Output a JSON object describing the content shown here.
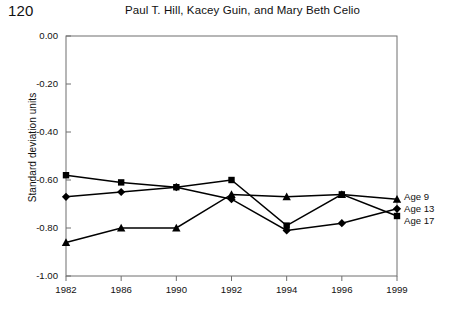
{
  "header": {
    "folio": "120",
    "running_title": "Paul T. Hill, Kacey Guin, and Mary Beth Celio"
  },
  "chart_data": {
    "type": "line",
    "title": "",
    "xlabel": "",
    "ylabel": "Standard deviation units",
    "categories": [
      "1982",
      "1986",
      "1990",
      "1992",
      "1994",
      "1996",
      "1999"
    ],
    "ylim": [
      -1.0,
      0.0
    ],
    "ytick_labels": [
      "0.00",
      "-0.20",
      "-0.40",
      "-0.60",
      "-0.80",
      "-1.00"
    ],
    "ytick_values": [
      0.0,
      -0.2,
      -0.4,
      -0.6,
      -0.8,
      -1.0
    ],
    "grid": false,
    "legend_position": "right-inline",
    "series": [
      {
        "name": "Age 17",
        "marker": "square",
        "color": "#000000",
        "values": [
          -0.58,
          -0.61,
          -0.63,
          -0.6,
          -0.79,
          -0.66,
          -0.75
        ]
      },
      {
        "name": "Age 13",
        "marker": "diamond",
        "color": "#000000",
        "values": [
          -0.67,
          -0.65,
          -0.63,
          -0.68,
          -0.81,
          -0.78,
          -0.72
        ]
      },
      {
        "name": "Age 9",
        "marker": "triangle",
        "color": "#000000",
        "values": [
          -0.86,
          -0.8,
          -0.8,
          -0.66,
          -0.67,
          -0.66,
          -0.68
        ]
      }
    ]
  }
}
